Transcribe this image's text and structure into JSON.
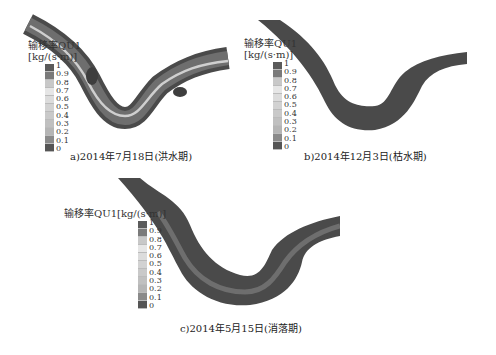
{
  "figure": {
    "legend": {
      "title_line1": "输移率QU1",
      "title_line2": "[kg/(s·m)]",
      "title_single": "输移率QU1[kg/(s·m)]",
      "ticks": [
        "1",
        "0.9",
        "0.8",
        "0.7",
        "0.6",
        "0.5",
        "0.4",
        "0.3",
        "0.2",
        "0.1",
        "0"
      ],
      "colors": [
        "#5a5a5a",
        "#7a7a7a",
        "#c8c8c8",
        "#e6e6e6",
        "#dcdcdc",
        "#d2d2d2",
        "#c9c9c9",
        "#c0c0c0",
        "#b5b5b5",
        "#8a8a8a",
        "#555555"
      ]
    },
    "panels": [
      {
        "id": "a",
        "caption": "a)2014年7月18日(洪水期)"
      },
      {
        "id": "b",
        "caption": "b)2014年12月3日(枯水期)"
      },
      {
        "id": "c",
        "caption": "c)2014年5月15日(消落期)"
      }
    ],
    "colors": {
      "river_dark": "#4a4a4a",
      "river_mid": "#6e6e6e",
      "river_light": "#cfcfcf",
      "background": "#ffffff"
    }
  }
}
